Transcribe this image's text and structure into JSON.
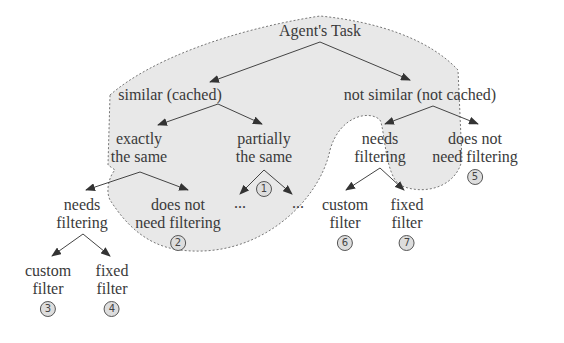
{
  "diagram": {
    "root": {
      "label": "Agent's Task"
    },
    "nodes": {
      "similar": {
        "label": "similar (cached)"
      },
      "not_similar": {
        "label": "not similar (not cached)"
      },
      "exactly_same": {
        "line1": "exactly",
        "line2": "the same"
      },
      "partially_same": {
        "line1": "partially",
        "line2": "the same",
        "badge": "1",
        "children": [
          "...",
          "..."
        ]
      },
      "left_needs_filtering": {
        "line1": "needs",
        "line2": "filtering"
      },
      "left_no_filtering": {
        "line1": "does not",
        "line2": "need filtering",
        "badge": "2"
      },
      "left_custom_filter": {
        "line1": "custom",
        "line2": "filter",
        "badge": "3"
      },
      "left_fixed_filter": {
        "line1": "fixed",
        "line2": "filter",
        "badge": "4"
      },
      "right_needs_filtering": {
        "line1": "needs",
        "line2": "filtering"
      },
      "right_no_filtering": {
        "line1": "does not",
        "line2": "need filtering",
        "badge": "5"
      },
      "right_custom_filter": {
        "line1": "custom",
        "line2": "filter",
        "badge": "6"
      },
      "right_fixed_filter": {
        "line1": "fixed",
        "line2": "filter",
        "badge": "7"
      }
    },
    "colors": {
      "shade": "#e8e8e8",
      "outline": "#777777",
      "edge": "#444444"
    }
  }
}
